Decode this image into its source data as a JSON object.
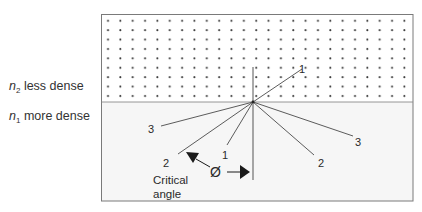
{
  "diagram": {
    "type": "total-internal-reflection",
    "media": {
      "upper": {
        "symbol": "n",
        "subscript": "2",
        "label": "less dense",
        "fill": "#ffffff",
        "pattern": "dots"
      },
      "lower": {
        "symbol": "n",
        "subscript": "1",
        "label": "more dense",
        "fill": "#f6f6f6"
      }
    },
    "rays": [
      {
        "id": "1",
        "label": "1",
        "description": "incident ray refracted into less dense medium"
      },
      {
        "id": "2",
        "label": "2",
        "description": "incident at critical angle, refracted along boundary"
      },
      {
        "id": "3",
        "label": "3",
        "description": "totally internally reflected ray"
      }
    ],
    "labels": {
      "ray1_incident": "1",
      "ray1_refracted": "1",
      "ray2_incident": "2",
      "ray2_reflected": "2",
      "ray3_incident": "3",
      "ray3_reflected": "3",
      "angle_symbol": "Ø",
      "critical_line1": "Critical",
      "critical_line2": "angle"
    },
    "colors": {
      "line": "#4a4a4a",
      "border": "#7a7a7a",
      "dot": "#3a3a3a",
      "arrow": "#1a1a1a"
    }
  }
}
